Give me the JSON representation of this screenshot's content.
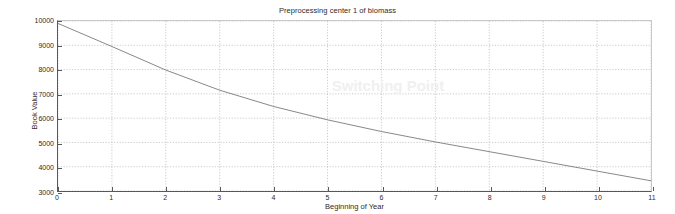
{
  "chart_data": {
    "type": "line",
    "title": "Preprocessing center 1 of biomass",
    "xlabel": "Beginning of Year",
    "ylabel": "Book Value",
    "xlim": [
      0,
      11
    ],
    "ylim": [
      3000,
      10000
    ],
    "grid": true,
    "grid_style": "dotted",
    "legend": null,
    "xticks": [
      "0",
      "1",
      "2",
      "3",
      "4",
      "5",
      "6",
      "7",
      "8",
      "9",
      "10",
      "11"
    ],
    "xtick_values": [
      0,
      1,
      2,
      3,
      4,
      5,
      6,
      7,
      8,
      9,
      10,
      11
    ],
    "yticks": [
      "3000",
      "4000",
      "5000",
      "6000",
      "7000",
      "8000",
      "9000",
      "10000"
    ],
    "ytick_values": [
      3000,
      4000,
      5000,
      6000,
      7000,
      8000,
      9000,
      10000
    ],
    "series": [
      {
        "name": "Book Value",
        "color": "#7a7a7a",
        "x": [
          0,
          1,
          2,
          3,
          4,
          5,
          6,
          7,
          8,
          9,
          10,
          11
        ],
        "values": [
          9900,
          8950,
          7980,
          7150,
          6480,
          5930,
          5450,
          5020,
          4620,
          4220,
          3820,
          3420
        ]
      }
    ],
    "annotations": [
      {
        "text": "Switching Point",
        "x": 6.1,
        "y": 7350,
        "style": "watermark"
      }
    ]
  }
}
